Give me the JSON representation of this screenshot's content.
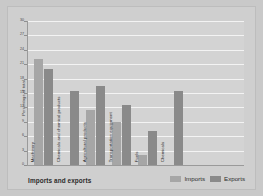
{
  "chart_data": {
    "type": "bar",
    "title": "",
    "xlabel": "Imports and exports",
    "ylabel": "Percentage of total",
    "categories": [
      "Machinery",
      "Chemicals and chemical products",
      "Agricultural products",
      "Transportation equipment",
      "Fuels",
      "Chemicals"
    ],
    "series": [
      {
        "name": "Imports",
        "color": "#a6a6a6",
        "values": [
          22,
          null,
          11.5,
          9,
          2,
          null
        ]
      },
      {
        "name": "Exports",
        "color": "#8a8a8a",
        "values": [
          20,
          15.5,
          16.5,
          12.5,
          7,
          15.5
        ]
      }
    ],
    "ylim": [
      0,
      30
    ],
    "ytick_values": [
      0,
      3,
      6,
      9,
      12,
      15,
      18,
      21,
      24,
      27,
      30
    ],
    "ytick_labels": [
      "0",
      "3",
      "6",
      "9",
      "12",
      "15",
      "18",
      "21",
      "24",
      "27",
      "30"
    ],
    "grid": true,
    "legend_position": "bottom-right"
  },
  "legend": {
    "items": [
      {
        "label": "Imports",
        "color": "#a6a6a6"
      },
      {
        "label": "Exports",
        "color": "#8a8a8a"
      }
    ]
  },
  "colors": {
    "background": "#c9c9c9",
    "card": "#cfcfcf",
    "plot": "#d3d3d3",
    "gridline": "#f3f3f3",
    "axis": "#9a9a9a",
    "imports": "#a6a6a6",
    "exports": "#8a8a8a"
  }
}
